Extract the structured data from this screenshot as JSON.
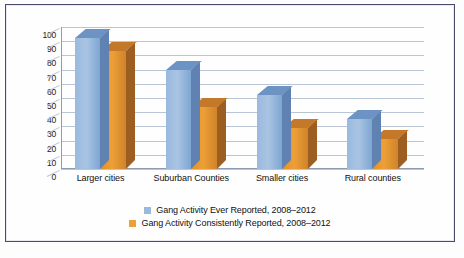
{
  "chart_data": {
    "type": "bar",
    "title": "",
    "subtitle": "",
    "xlabel": "",
    "ylabel": "",
    "ylim": [
      0,
      100
    ],
    "ytick_step": 10,
    "yticks": [
      "100",
      "90",
      "80",
      "70",
      "60",
      "50",
      "40",
      "30",
      "20",
      "10",
      "0"
    ],
    "grid": true,
    "legend_position": "bottom",
    "style": "3d-column",
    "categories": [
      "Larger cities",
      "Suburban Counties",
      "Smaller cities",
      "Rural counties"
    ],
    "series": [
      {
        "name": "Gang Activity Ever Reported, 2008–2012",
        "color": "#9ab9de",
        "values": [
          92,
          70,
          52,
          35
        ]
      },
      {
        "name": "Gang Activity Consistently Reported, 2008–2012",
        "color": "#ed9f38",
        "values": [
          83,
          44,
          29,
          21
        ]
      }
    ]
  },
  "legend": {
    "items": [
      {
        "label": "Gang Activity Ever Reported, 2008–2012",
        "swatch": "blue-sw"
      },
      {
        "label": "Gang Activity Consistently Reported, 2008–2012",
        "swatch": "orange-sw"
      }
    ]
  },
  "caption": {
    "text": ""
  },
  "colors": {
    "frame_border": "#4a4a6b",
    "gridline": "#b9c4d4",
    "axis": "#8f9bb0",
    "series_blue": "#9ab9de",
    "series_orange": "#ed9f38",
    "background": "#fefefe"
  }
}
